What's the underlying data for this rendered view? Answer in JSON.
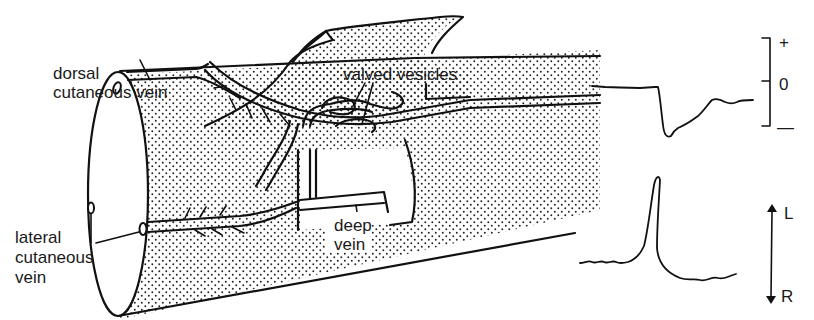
{
  "figure": {
    "type": "anatomical diagram with signal traces",
    "labels": {
      "dorsal_vein_line1": "dorsal",
      "dorsal_vein_line2": "cutaneous vein",
      "valved_vesicles": "valved vesicles",
      "lateral_vein_line1": "lateral",
      "lateral_vein_line2": "cutaneous",
      "lateral_vein_line3": "vein",
      "deep_vein_line1": "deep",
      "deep_vein_line2": "vein"
    },
    "trace_top": {
      "description": "pressure trace with negative deflection",
      "scale_labels": {
        "plus": "+",
        "zero": "0",
        "minus": "—"
      }
    },
    "trace_bottom": {
      "description": "displacement trace with single sharp positive spike",
      "direction_labels": {
        "up": "L",
        "down": "R"
      }
    },
    "colors": {
      "ink": "#111111",
      "background": "#ffffff"
    }
  }
}
